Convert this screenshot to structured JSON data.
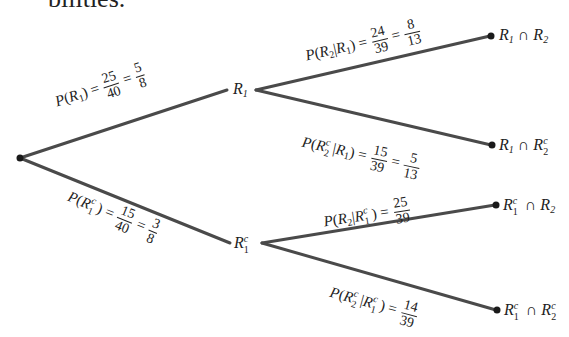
{
  "header_fragment": "bilities.",
  "diagram": {
    "type": "probability-tree",
    "root": {
      "label": ""
    },
    "level1": [
      {
        "node": "R1",
        "edge_label": "P(R1) = 25/40 = 5/8",
        "prob_num": "25",
        "prob_den": "40",
        "simplified_num": "5",
        "simplified_den": "8"
      },
      {
        "node": "R1^c",
        "edge_label": "P(R1^c) = 15/40 = 3/8",
        "prob_num": "15",
        "prob_den": "40",
        "simplified_num": "3",
        "simplified_den": "8"
      }
    ],
    "level2": [
      {
        "parent": "R1",
        "outcome": "R1 ∩ R2",
        "edge_label": "P(R2 | R1) = 24/39 = 8/13",
        "prob_num": "24",
        "prob_den": "39",
        "simplified_num": "8",
        "simplified_den": "13"
      },
      {
        "parent": "R1",
        "outcome": "R1 ∩ R2^c",
        "edge_label": "P(R2^c | R1) = 15/39 = 5/13",
        "prob_num": "15",
        "prob_den": "39",
        "simplified_num": "5",
        "simplified_den": "13"
      },
      {
        "parent": "R1^c",
        "outcome": "R1^c ∩ R2",
        "edge_label": "P(R2 | R1^c) = 25/39",
        "prob_num": "25",
        "prob_den": "39"
      },
      {
        "parent": "R1^c",
        "outcome": "R1^c ∩ R2^c",
        "edge_label": "P(R2^c | R1^c) = 14/39",
        "prob_num": "14",
        "prob_den": "39"
      }
    ],
    "symbols": {
      "P": "P",
      "R": "R",
      "cap": "∩",
      "bar": "|",
      "eq": "=",
      "lp": "(",
      "rp": ")",
      "c": "c",
      "one": "1",
      "two": "2"
    },
    "line_color": "#4a4a4a"
  }
}
